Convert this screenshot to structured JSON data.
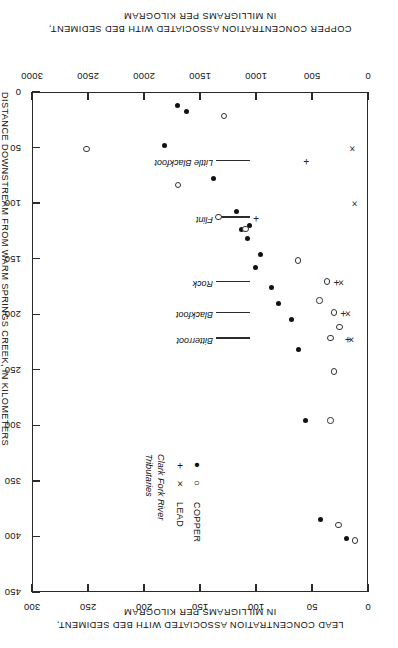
{
  "figure": {
    "rotation_deg": 180,
    "note_orientation": "printed upside down"
  },
  "axes": {
    "distance": {
      "title": "DISTANCE DOWNSTREAM FROM WARM SPRINGS CREEK, IN KILOMETERS",
      "ticks": [
        "0",
        "50",
        "100",
        "150",
        "200",
        "250",
        "300",
        "350",
        "400",
        "450"
      ],
      "min": 0,
      "max": 450
    },
    "copper": {
      "title_line1": "COPPER CONCENTRATION ASSOCIATED WITH BED SEDIMENT,",
      "title_line2": "IN MILLIGRAMS PER KILOGRAM",
      "ticks": [
        "0",
        "500",
        "1000",
        "1500",
        "2000",
        "2500",
        "3000"
      ],
      "min": 0,
      "max": 3000
    },
    "lead": {
      "title_line1": "LEAD CONCENTRATION ASSOCIATED WITH BED SEDIMENT,",
      "title_line2": "IN MILLIGRAMS PER KILOGRAM",
      "ticks": [
        "0",
        "50",
        "100",
        "150",
        "200",
        "250",
        "300"
      ],
      "min": 0,
      "max": 300
    }
  },
  "legend": {
    "col_copper": "COPPER",
    "col_lead": "LEAD",
    "row_mainstem": "Clark Fork River",
    "row_tributary": "Tributaries",
    "sym_copper_mainstem": "filled-circle",
    "sym_lead_mainstem": "plus",
    "sym_copper_tributary": "open-circle",
    "sym_lead_tributary": "cross"
  },
  "tributaries": [
    {
      "name": "Little Blackfoot",
      "distance_km": 62
    },
    {
      "name": "Flint",
      "distance_km": 113
    },
    {
      "name": "Rock",
      "distance_km": 171
    },
    {
      "name": "Blackfoot",
      "distance_km": 199
    },
    {
      "name": "Bitterroot",
      "distance_km": 222
    }
  ],
  "chart_data": {
    "type": "scatter",
    "title": "",
    "xlabel": "DISTANCE DOWNSTREAM FROM WARM SPRINGS CREEK, IN KILOMETERS",
    "ylabel_copper": "COPPER CONCENTRATION ASSOCIATED WITH BED SEDIMENT, IN MILLIGRAMS PER KILOGRAM",
    "ylabel_lead": "LEAD CONCENTRATION ASSOCIATED WITH BED SEDIMENT, IN MILLIGRAMS PER KILOGRAM",
    "xlim": [
      0,
      450
    ],
    "copper_lim": [
      0,
      3000
    ],
    "lead_lim": [
      0,
      300
    ],
    "grid": false,
    "legend_position": "upper-right-inside",
    "series": [
      {
        "name": "Clark Fork River copper",
        "marker": "filled-circle",
        "axis": "copper",
        "points": [
          {
            "distance_km": 12,
            "value": 1700
          },
          {
            "distance_km": 18,
            "value": 1620
          },
          {
            "distance_km": 48,
            "value": 1820
          },
          {
            "distance_km": 78,
            "value": 1380
          },
          {
            "distance_km": 108,
            "value": 1170
          },
          {
            "distance_km": 120,
            "value": 1060
          },
          {
            "distance_km": 124,
            "value": 1130
          },
          {
            "distance_km": 132,
            "value": 1080
          },
          {
            "distance_km": 146,
            "value": 960
          },
          {
            "distance_km": 158,
            "value": 1000
          },
          {
            "distance_km": 176,
            "value": 860
          },
          {
            "distance_km": 190,
            "value": 800
          },
          {
            "distance_km": 205,
            "value": 680
          },
          {
            "distance_km": 232,
            "value": 620
          },
          {
            "distance_km": 296,
            "value": 560
          },
          {
            "distance_km": 385,
            "value": 420
          },
          {
            "distance_km": 402,
            "value": 190
          }
        ]
      },
      {
        "name": "Tributaries copper",
        "marker": "open-circle",
        "axis": "copper",
        "points": [
          {
            "distance_km": 22,
            "value": 1280
          },
          {
            "distance_km": 52,
            "value": 2510
          },
          {
            "distance_km": 84,
            "value": 1690
          },
          {
            "distance_km": 113,
            "value": 1330
          },
          {
            "distance_km": 124,
            "value": 1090
          },
          {
            "distance_km": 152,
            "value": 620
          },
          {
            "distance_km": 171,
            "value": 360
          },
          {
            "distance_km": 188,
            "value": 430
          },
          {
            "distance_km": 199,
            "value": 300
          },
          {
            "distance_km": 212,
            "value": 250
          },
          {
            "distance_km": 222,
            "value": 330
          },
          {
            "distance_km": 252,
            "value": 300
          },
          {
            "distance_km": 296,
            "value": 330
          },
          {
            "distance_km": 390,
            "value": 260
          },
          {
            "distance_km": 404,
            "value": 110
          }
        ]
      },
      {
        "name": "Clark Fork River lead",
        "marker": "plus",
        "axis": "lead",
        "points": [
          {
            "distance_km": 62,
            "value": 55
          },
          {
            "distance_km": 113,
            "value": 100
          },
          {
            "distance_km": 171,
            "value": 28
          },
          {
            "distance_km": 199,
            "value": 22
          },
          {
            "distance_km": 222,
            "value": 18
          }
        ]
      },
      {
        "name": "Tributaries lead",
        "marker": "cross",
        "axis": "lead",
        "points": [
          {
            "distance_km": 50,
            "value": 14
          },
          {
            "distance_km": 100,
            "value": 12
          },
          {
            "distance_km": 171,
            "value": 24
          },
          {
            "distance_km": 199,
            "value": 18
          },
          {
            "distance_km": 222,
            "value": 15
          }
        ]
      }
    ]
  }
}
